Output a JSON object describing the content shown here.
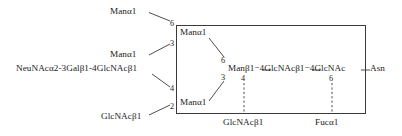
{
  "figure": {
    "type": "glycan-structure-diagram",
    "title": "",
    "residues": {
      "outer_mannose_upper": "Manα1",
      "outer_mannose_lower": "Manα1",
      "core_mannose_upper": "Manα1",
      "core_mannose_lower": "Manα1",
      "sialyl_lactosamine_branch": "NeuNAcα2-3Galβ1-4GlcNAcβ1",
      "bisecting_glcnac": "GlcNAcβ1",
      "core_chain": "Manβ1−4GlcNAcβ1−4GlcNAc",
      "asparagine": "Asn",
      "bisecting_glcnac_bottom": "GlcNAcβ1",
      "core_fucose": "Fucα1"
    },
    "linkage_positions": {
      "outer_upper_to_core_upper": "6",
      "outer_lower_to_core_upper": "3",
      "branch_to_core_lower": "4",
      "bisecting_to_core_lower": "2",
      "core_upper_to_man_beta": "6",
      "core_lower_to_man_beta": "3",
      "man_beta_bisecting": "4",
      "glcnac_fucose": "6"
    },
    "colors": {
      "stroke": "#3a3a3a",
      "text": "#1a1a1a",
      "background": "#ffffff"
    }
  }
}
